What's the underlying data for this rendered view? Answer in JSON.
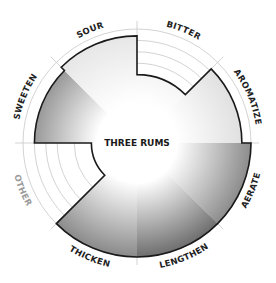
{
  "chart_data": {
    "type": "radial-bar",
    "title": "THREE RUMS",
    "scale_max": 1.0,
    "grid_rings": [
      0.55,
      0.7,
      0.8,
      0.9
    ],
    "start_angle_deg": 0,
    "direction": "clockwise",
    "categories": [
      "BITTER",
      "AROMATIZE",
      "AERATE",
      "LENGTHEN",
      "THICKEN",
      "OTHER",
      "SWEETEN",
      "SOUR"
    ],
    "values": [
      0.6,
      0.92,
      1.0,
      1.0,
      1.0,
      0.4,
      0.9,
      0.94
    ],
    "sector_colors": [
      "#e6e6e6",
      "#dcdcdc",
      "#8c8c8c",
      "#6e6e6e",
      "#8a8a8a",
      "#ffffff",
      "#868686",
      "#e4e4e4"
    ],
    "label_colors": [
      "#222222",
      "#222222",
      "#222222",
      "#222222",
      "#222222",
      "#9a9a9a",
      "#222222",
      "#222222"
    ],
    "outline_color": "#1a1a1a",
    "grid_color": "#c8c8c8"
  }
}
